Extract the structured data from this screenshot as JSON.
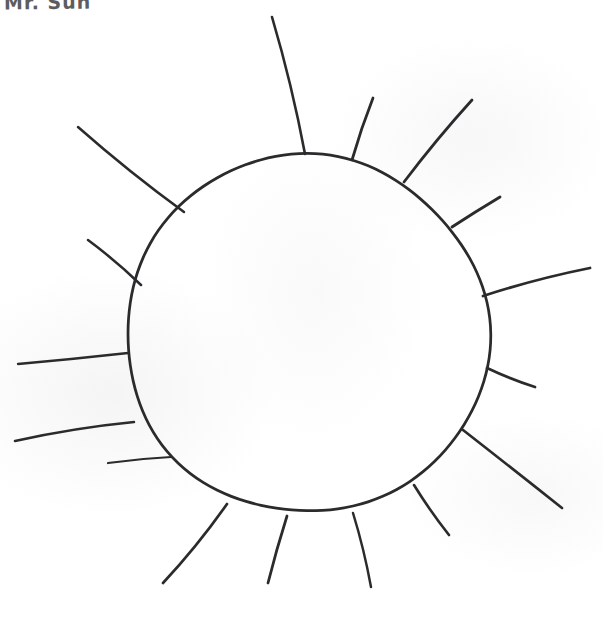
{
  "page": {
    "title": "Mr. Sun",
    "background_color": "#ffffff",
    "width": 603,
    "height": 634
  },
  "caption": {
    "text": "Mr. Sun",
    "note": "handwritten label clipped by the top edge of the page"
  },
  "drawing": {
    "name": "sun",
    "medium": "hand-drawn pen sketch on white paper",
    "ink_color": "#2b2b2d",
    "stroke_width": 2.6,
    "core": {
      "shape": "circle",
      "center_x": 307,
      "center_y": 334,
      "radius": 180,
      "fill": "none"
    },
    "ray_count": 16,
    "rays": [
      {
        "id": "ray-01",
        "x1": 305,
        "y1": 154,
        "x2": 272,
        "y2": 17,
        "length": 141
      },
      {
        "id": "ray-02",
        "x1": 352,
        "y1": 160,
        "x2": 373,
        "y2": 98,
        "length": 65
      },
      {
        "id": "ray-03",
        "x1": 404,
        "y1": 182,
        "x2": 472,
        "y2": 100,
        "length": 107
      },
      {
        "id": "ray-04",
        "x1": 452,
        "y1": 227,
        "x2": 500,
        "y2": 197,
        "length": 57
      },
      {
        "id": "ray-05",
        "x1": 483,
        "y1": 296,
        "x2": 590,
        "y2": 268,
        "length": 110
      },
      {
        "id": "ray-06",
        "x1": 487,
        "y1": 368,
        "x2": 535,
        "y2": 387,
        "length": 52
      },
      {
        "id": "ray-07",
        "x1": 463,
        "y1": 430,
        "x2": 562,
        "y2": 508,
        "length": 126
      },
      {
        "id": "ray-08",
        "x1": 414,
        "y1": 485,
        "x2": 449,
        "y2": 535,
        "length": 61
      },
      {
        "id": "ray-09",
        "x1": 353,
        "y1": 513,
        "x2": 371,
        "y2": 587,
        "length": 76
      },
      {
        "id": "ray-10",
        "x1": 287,
        "y1": 516,
        "x2": 268,
        "y2": 583,
        "length": 70
      },
      {
        "id": "ray-11",
        "x1": 227,
        "y1": 504,
        "x2": 163,
        "y2": 583,
        "length": 102
      },
      {
        "id": "ray-12",
        "x1": 171,
        "y1": 457,
        "x2": 108,
        "y2": 463,
        "length": 63
      },
      {
        "id": "ray-13",
        "x1": 134,
        "y1": 422,
        "x2": 15,
        "y2": 441,
        "length": 121
      },
      {
        "id": "ray-14",
        "x1": 128,
        "y1": 353,
        "x2": 18,
        "y2": 364,
        "length": 111
      },
      {
        "id": "ray-15",
        "x1": 141,
        "y1": 285,
        "x2": 88,
        "y2": 240,
        "length": 70
      },
      {
        "id": "ray-16",
        "x1": 184,
        "y1": 212,
        "x2": 78,
        "y2": 127,
        "length": 136
      }
    ]
  }
}
